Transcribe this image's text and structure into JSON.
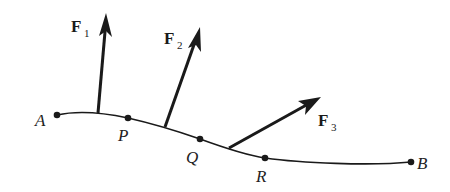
{
  "diagram": {
    "colors": {
      "ink": "#1a1a1a",
      "background": "#ffffff"
    },
    "curve": {
      "points": [
        {
          "label": "A",
          "x": 57,
          "y": 115
        },
        {
          "label": "P",
          "x": 128,
          "y": 118
        },
        {
          "label": "Q",
          "x": 200,
          "y": 139
        },
        {
          "label": "R",
          "x": 265,
          "y": 158
        },
        {
          "label": "B",
          "x": 411,
          "y": 162
        }
      ]
    },
    "forces": [
      {
        "name": "F",
        "subscript": "1",
        "base": [
          98,
          113
        ],
        "tip": [
          106,
          15
        ]
      },
      {
        "name": "F",
        "subscript": "2",
        "base": [
          165,
          127
        ],
        "tip": [
          200,
          28
        ]
      },
      {
        "name": "F",
        "subscript": "3",
        "base": [
          229,
          148
        ],
        "tip": [
          320,
          98
        ]
      }
    ],
    "labels": {
      "A": "A",
      "P": "P",
      "Q": "Q",
      "R": "R",
      "B": "B",
      "F1": "F",
      "F1_sub": "1",
      "F2": "F",
      "F2_sub": "2",
      "F3": "F",
      "F3_sub": "3"
    }
  }
}
